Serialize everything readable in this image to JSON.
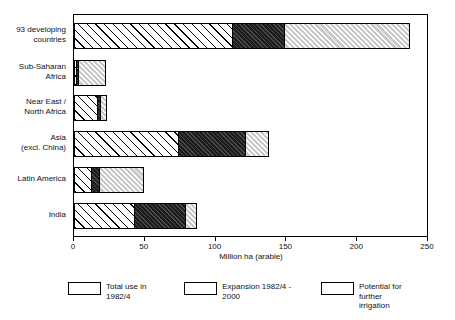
{
  "chart_data": {
    "type": "bar",
    "orientation": "horizontal",
    "stacked": true,
    "title": "",
    "xlabel": "Million ha (arable)",
    "ylabel": "",
    "xlim": [
      0,
      250
    ],
    "xticks": [
      0,
      50,
      100,
      150,
      200,
      250
    ],
    "xtick_labels": [
      "0",
      "50",
      "100",
      "150",
      "200",
      "250"
    ],
    "grid": false,
    "legend_position": "bottom",
    "categories": [
      "93 developing\ncountries",
      "Sub-Saharan\nAfrica",
      "Near East /\nNorth Africa",
      "Asia\n(excl. China)",
      "Latin America",
      "India"
    ],
    "series": [
      {
        "name": "Total use in 1982/4",
        "pattern": "forward-hatch-on-white",
        "values": [
          112,
          2,
          17,
          74,
          13,
          43
        ]
      },
      {
        "name": "Expansion 1982/4 - 2000",
        "pattern": "dense-hatch-on-black",
        "values": [
          38,
          2,
          3,
          48,
          6,
          37
        ]
      },
      {
        "name": "Potential for further irrigation",
        "pattern": "hatch-on-grey",
        "values": [
          89,
          20,
          5,
          17,
          32,
          8
        ]
      }
    ],
    "totals": [
      239,
      24,
      25,
      139,
      51,
      88
    ]
  },
  "legend": {
    "items": [
      {
        "label": "Total use in 1982/4"
      },
      {
        "label": "Expansion 1982/4 - 2000"
      },
      {
        "label": "Potential for further\nirrigation"
      }
    ]
  },
  "colors": {
    "total_use_bg": "#ffffff",
    "expansion_bg": "#1c1c1c",
    "potential_bg": "#c9c9c9",
    "axis": "#000000",
    "text": "#111111"
  }
}
